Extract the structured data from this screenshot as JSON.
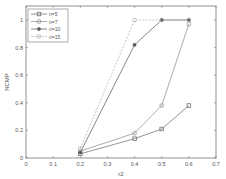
{
  "chart_data": {
    "type": "line",
    "title": "",
    "xlabel": "r2",
    "ylabel": "NCMP",
    "xlim": [
      0,
      0.7
    ],
    "ylim": [
      0,
      1.1
    ],
    "xticks": [
      0,
      0.1,
      0.2,
      0.3,
      0.4,
      0.5,
      0.6,
      0.7
    ],
    "xtick_labels": [
      "0",
      "0.1",
      "0.2",
      "0.3",
      "0.4",
      "0.5",
      "0.6",
      "0.7"
    ],
    "yticks": [
      0,
      0.2,
      0.4,
      0.6,
      0.8,
      1
    ],
    "ytick_labels": [
      "0",
      "0.2",
      "0.4",
      "0.6",
      "0.8",
      "1"
    ],
    "grid": false,
    "legend_position": "upper left",
    "x": [
      0.2,
      0.4,
      0.5,
      0.6
    ],
    "series": [
      {
        "name": "n=5",
        "marker": "square",
        "linestyle": "solid",
        "values": [
          0.03,
          0.14,
          0.21,
          0.38
        ]
      },
      {
        "name": "n=7",
        "marker": "circle",
        "linestyle": "solid",
        "values": [
          0.05,
          0.18,
          0.38,
          0.97
        ]
      },
      {
        "name": "n=10",
        "marker": "star",
        "linestyle": "solid",
        "values": [
          0.04,
          0.82,
          1.0,
          1.0
        ]
      },
      {
        "name": "n=15",
        "marker": "circle",
        "linestyle": "dashed",
        "values": [
          0.07,
          1.0,
          1.0,
          1.0
        ]
      }
    ]
  }
}
